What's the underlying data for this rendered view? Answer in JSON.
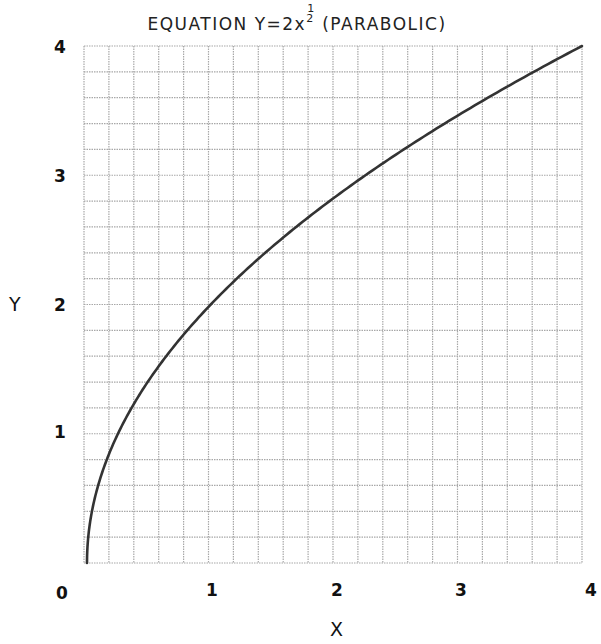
{
  "title": {
    "prefix": "EQUATION Y=2x",
    "exponent_numerator": "1",
    "exponent_denominator": "2",
    "suffix": "(PARABOLIC)"
  },
  "axes": {
    "x_label": "X",
    "y_label": "Y",
    "x_ticks": [
      "0",
      "1",
      "2",
      "3",
      "4"
    ],
    "y_ticks": [
      "1",
      "2",
      "3",
      "4"
    ]
  },
  "colors": {
    "grid": "#a8a8a8",
    "curve": "#333333",
    "text": "#111111"
  },
  "chart_data": {
    "type": "line",
    "xlabel": "X",
    "ylabel": "Y",
    "xlim": [
      0,
      4
    ],
    "ylim": [
      0,
      4
    ],
    "grid": true,
    "grid_divisions": {
      "x": 20,
      "y": 20
    },
    "x_tick_labels": [
      "0",
      "1",
      "2",
      "3",
      "4"
    ],
    "y_tick_labels": [
      "1",
      "2",
      "3",
      "4"
    ],
    "legend": null,
    "series": [
      {
        "name": "Y=2x^(1/2)",
        "x": [
          0,
          0.05,
          0.1,
          0.2,
          0.3,
          0.4,
          0.5,
          0.6,
          0.8,
          1.0,
          1.25,
          1.5,
          2.0,
          2.25,
          2.5,
          3.0,
          3.5,
          4.0
        ],
        "values": [
          0,
          0.447,
          0.632,
          0.894,
          1.095,
          1.265,
          1.414,
          1.549,
          1.789,
          2.0,
          2.236,
          2.449,
          2.828,
          3.0,
          3.162,
          3.464,
          3.742,
          4.0
        ]
      }
    ]
  }
}
